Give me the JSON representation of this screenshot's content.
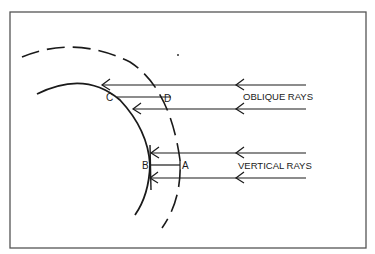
{
  "diagram": {
    "labels": {
      "oblique": "OBLIQUE RAYS",
      "vertical": "VERTICAL RAYS"
    },
    "points": {
      "a": "A",
      "b": "B",
      "c": "C",
      "d": "D"
    },
    "colors": {
      "ink": "#1a1a1a",
      "frame": "#555555",
      "background": "#ffffff"
    }
  }
}
